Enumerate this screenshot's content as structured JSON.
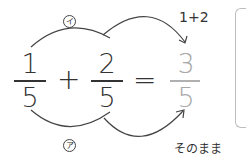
{
  "equation": {
    "term1": {
      "numerator": "1",
      "denominator": "5"
    },
    "operator_plus": "+",
    "term2": {
      "numerator": "2",
      "denominator": "5"
    },
    "operator_equals": "=",
    "result": {
      "numerator": "3",
      "denominator": "5"
    }
  },
  "annotations": {
    "top_marker": "イ",
    "bottom_marker": "ア",
    "numerator_note": "1+2",
    "denominator_note": "そのまま"
  },
  "colors": {
    "ink": "#333333",
    "result_gray": "#a8a8a8",
    "frame_gray": "#bdbdbd"
  }
}
